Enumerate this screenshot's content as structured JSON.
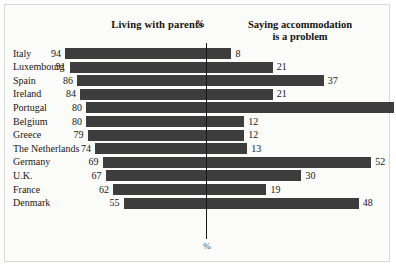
{
  "header": {
    "left_title": "Living with parents",
    "center_symbol": "%",
    "right_title_line1": "Saying accommodation",
    "right_title_line2": "is a problem"
  },
  "axis": {
    "bottom_label": "%"
  },
  "colors": {
    "bar": "#3d3d3d",
    "background": "#fbfbfa",
    "axis": "#171717",
    "text": "#1a1714"
  },
  "chart_data": {
    "type": "bar",
    "title": "",
    "subtitle": "",
    "orientation": "horizontal",
    "layout": "bidirectional-pyramid",
    "xlabel": "%",
    "ylabel": "",
    "grid": false,
    "legend_position": "top",
    "categories": [
      "Italy",
      "Luxembourg",
      "Spain",
      "Ireland",
      "Portugal",
      "Belgium",
      "Greece",
      "The Netherlands",
      "Germany",
      "U.K.",
      "France",
      "Denmark"
    ],
    "series": [
      {
        "name": "Living with parents",
        "side": "left",
        "unit": "%",
        "values": [
          94,
          91,
          86,
          84,
          80,
          80,
          79,
          74,
          69,
          67,
          62,
          55
        ]
      },
      {
        "name": "Saying accommodation is a problem",
        "side": "right",
        "unit": "%",
        "values": [
          8,
          21,
          37,
          21,
          59,
          12,
          12,
          13,
          52,
          30,
          19,
          48
        ]
      }
    ],
    "xlim_left": [
      0,
      100
    ],
    "xlim_right": [
      0,
      100
    ]
  }
}
